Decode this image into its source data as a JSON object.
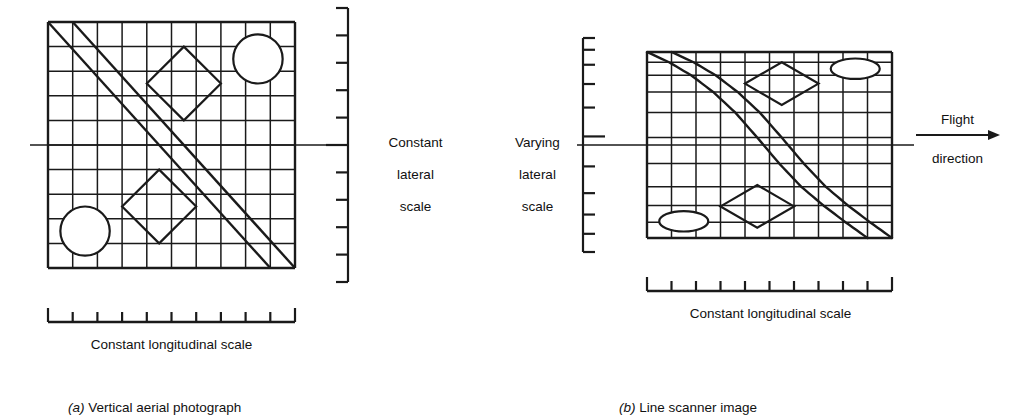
{
  "figure": {
    "ink_color": "#1a1a1a",
    "background_color": "#ffffff"
  },
  "panel_a": {
    "caption_marker": "(a)",
    "caption_text": " Vertical aerial photograph",
    "frame": {
      "x": 48,
      "y": 22,
      "width": 247,
      "height": 246
    },
    "grid": {
      "type": "uniform-square",
      "columns": 10,
      "rows": 10,
      "cell_width": 24.7,
      "cell_height": 24.6,
      "x_fractions": [
        0,
        0.1,
        0.2,
        0.3,
        0.4,
        0.5,
        0.6,
        0.7,
        0.8,
        0.9,
        1
      ],
      "y_fractions": [
        0,
        0.1,
        0.2,
        0.3,
        0.4,
        0.5,
        0.6,
        0.7,
        0.8,
        0.9,
        1
      ]
    },
    "features": {
      "circles": [
        {
          "name": "circle-top-right",
          "cx_frac": 0.85,
          "cy_frac": 0.15,
          "r_frac": 0.1,
          "shape": "circle"
        },
        {
          "name": "circle-bottom-left",
          "cx_frac": 0.15,
          "cy_frac": 0.85,
          "r_frac": 0.1,
          "shape": "circle"
        }
      ],
      "diamonds": [
        {
          "name": "diamond-upper",
          "cx_frac": 0.55,
          "cy_frac": 0.25,
          "rx_frac": 0.15,
          "ry_frac": 0.15
        },
        {
          "name": "diamond-lower",
          "cx_frac": 0.45,
          "cy_frac": 0.75,
          "rx_frac": 0.15,
          "ry_frac": 0.15
        }
      ],
      "diagonals": [
        {
          "name": "diagonal-upper",
          "from": [
            0.0,
            0.0
          ],
          "to": [
            0.9,
            1.0
          ],
          "curved": false
        },
        {
          "name": "diagonal-lower",
          "from": [
            0.1,
            0.0
          ],
          "to": [
            1.0,
            1.0
          ],
          "curved": false
        }
      ]
    },
    "lateral_ruler": {
      "label": "Constant\nlateral\nscale",
      "label_lines": [
        "Constant",
        "lateral",
        "scale"
      ],
      "orientation": "vertical",
      "spacing": "uniform",
      "tick_count": 11,
      "tick_fractions": [
        0,
        0.1,
        0.2,
        0.3,
        0.4,
        0.5,
        0.6,
        0.7,
        0.8,
        0.9,
        1
      ],
      "center_tick_index": 5
    },
    "longitudinal_ruler": {
      "label": "Constant longitudinal scale",
      "orientation": "horizontal",
      "spacing": "uniform",
      "tick_count": 11,
      "tick_fractions": [
        0,
        0.1,
        0.2,
        0.3,
        0.4,
        0.5,
        0.6,
        0.7,
        0.8,
        0.9,
        1
      ]
    },
    "center_line": {
      "name": "nadir-line",
      "y_frac": 0.5
    }
  },
  "panel_b": {
    "caption_marker": "(b)",
    "caption_text": " Line scanner image",
    "frame": {
      "x": 647,
      "y": 52,
      "width": 245,
      "height": 186
    },
    "grid": {
      "type": "distorted-scanner",
      "columns": 10,
      "rows": 10,
      "note": "lateral (vertical) spacing compressed near edges, expanded near centre; longitudinal (horizontal) spacing uniform",
      "x_fractions": [
        0,
        0.1,
        0.2,
        0.3,
        0.4,
        0.5,
        0.6,
        0.7,
        0.8,
        0.9,
        1
      ],
      "y_fractions": [
        0,
        0.055,
        0.125,
        0.215,
        0.325,
        0.46,
        0.6,
        0.725,
        0.825,
        0.915,
        1
      ]
    },
    "features": {
      "circles": [
        {
          "name": "ellipse-top-right",
          "cx_frac": 0.85,
          "cy_frac": 0.09,
          "rx_frac": 0.1,
          "ry_frac": 0.055,
          "shape": "ellipse"
        },
        {
          "name": "ellipse-bottom-left",
          "cx_frac": 0.15,
          "cy_frac": 0.91,
          "rx_frac": 0.1,
          "ry_frac": 0.055,
          "shape": "ellipse"
        }
      ],
      "diamonds": [
        {
          "name": "diamond-upper",
          "cx_frac": 0.55,
          "cy_frac": 0.17,
          "rx_frac": 0.15,
          "ry_frac": 0.115
        },
        {
          "name": "diamond-lower",
          "cx_frac": 0.45,
          "cy_frac": 0.83,
          "rx_frac": 0.15,
          "ry_frac": 0.115
        }
      ],
      "diagonals": [
        {
          "name": "diagonal-upper",
          "from": [
            0.0,
            0.0
          ],
          "to": [
            0.9,
            1.0
          ],
          "curved": true
        },
        {
          "name": "diagonal-lower",
          "from": [
            0.1,
            0.0
          ],
          "to": [
            1.0,
            1.0
          ],
          "curved": true
        }
      ]
    },
    "lateral_ruler": {
      "label": "Varying\nlateral\nscale",
      "label_lines": [
        "Varying",
        "lateral",
        "scale"
      ],
      "orientation": "vertical",
      "spacing": "varying",
      "tick_count": 11,
      "tick_fractions": [
        0,
        0.055,
        0.125,
        0.215,
        0.325,
        0.46,
        0.6,
        0.725,
        0.825,
        0.915,
        1
      ],
      "center_tick_index": 5
    },
    "longitudinal_ruler": {
      "label": "Constant longitudinal scale",
      "orientation": "horizontal",
      "spacing": "uniform",
      "tick_count": 11,
      "tick_fractions": [
        0,
        0.1,
        0.2,
        0.3,
        0.4,
        0.5,
        0.6,
        0.7,
        0.8,
        0.9,
        1
      ]
    },
    "center_line": {
      "name": "nadir-line",
      "y_frac": 0.5
    },
    "flight_arrow": {
      "label_above": "Flight",
      "label_below": "direction",
      "direction": "right"
    }
  }
}
